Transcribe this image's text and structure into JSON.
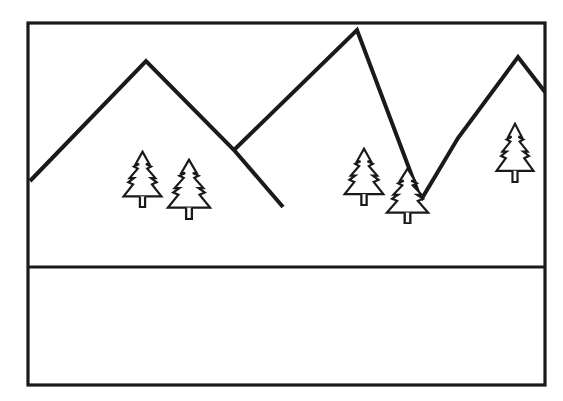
{
  "canvas": {
    "width": 563,
    "height": 401,
    "background_color": "#ffffff"
  },
  "drawing": {
    "title": "Mountain Landscape Line Drawing",
    "style": "black-outline-line-art",
    "line_color": "#1a1a1a",
    "fill_color": "#ffffff"
  },
  "frame": {
    "name": "outer-border",
    "x": 28,
    "y": 23,
    "width": 517,
    "height": 362,
    "stroke_width": 3.2,
    "stroke_color": "#1a1a1a",
    "fill_color": "#ffffff"
  },
  "divider": {
    "name": "horizon-divider",
    "label": "foreground-ground-line",
    "x1": 28,
    "y1": 267,
    "x2": 545,
    "y2": 267,
    "stroke_width": 3.0,
    "stroke_color": "#1a1a1a"
  },
  "mountains": {
    "stroke_width": 4.0,
    "stroke_color": "#1a1a1a",
    "peaks": [
      {
        "name": "peak-left",
        "apex_x": 146,
        "apex_y": 61
      },
      {
        "name": "peak-center",
        "apex_x": 357,
        "apex_y": 30
      },
      {
        "name": "peak-right",
        "apex_x": 518,
        "apex_y": 57
      }
    ],
    "ridges": [
      {
        "name": "ridge-left",
        "points": "30,181 146,61 234,150 283,207"
      },
      {
        "name": "ridge-center",
        "points": "234,150 357,30 421,200"
      },
      {
        "name": "ridge-right",
        "points": "421,200 458,138 518,57 545,92"
      }
    ]
  },
  "trees": {
    "stroke_width": 2.2,
    "stroke_color": "#1a1a1a",
    "fill_color": "#ffffff",
    "items": [
      {
        "name": "tree-left-tall",
        "x": 121,
        "y": 150,
        "width": 43,
        "height": 58,
        "group": "left-grove"
      },
      {
        "name": "tree-left-short",
        "x": 165,
        "y": 158,
        "width": 48,
        "height": 62,
        "group": "left-grove"
      },
      {
        "name": "tree-center-tall",
        "x": 342,
        "y": 147,
        "width": 44,
        "height": 59,
        "group": "center-grove"
      },
      {
        "name": "tree-center-short",
        "x": 384,
        "y": 167,
        "width": 47,
        "height": 57,
        "group": "center-grove"
      },
      {
        "name": "tree-right-single",
        "x": 494,
        "y": 122,
        "width": 42,
        "height": 61,
        "group": "right-grove"
      }
    ]
  },
  "regions": {
    "sky": {
      "name": "sky-region",
      "label": "sky"
    },
    "foreground": {
      "name": "foreground-region",
      "label": "foreground-blank-band"
    }
  }
}
